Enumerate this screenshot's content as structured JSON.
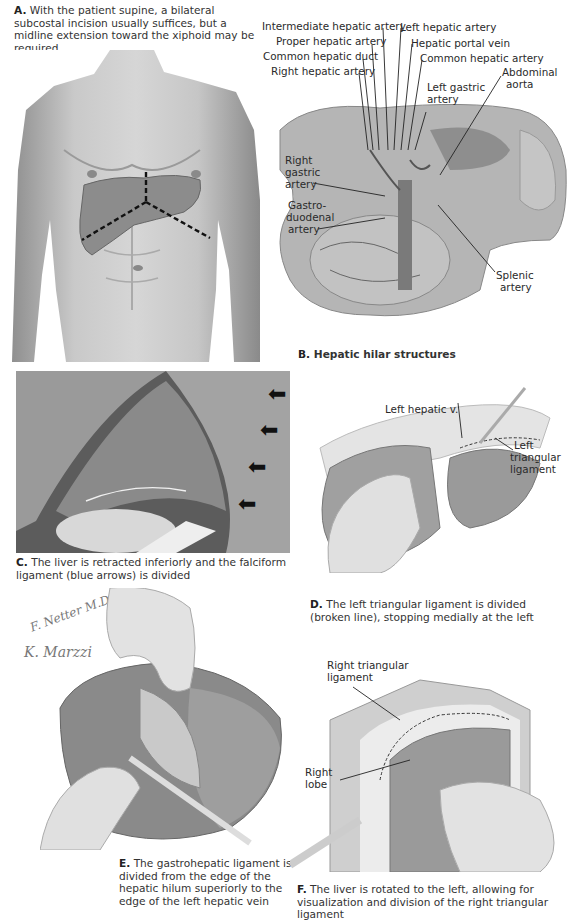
{
  "panels": {
    "A": {
      "letter": "A.",
      "caption": " With the patient supine, a bilateral subcostal incision usually suffices, but a midline extension toward the xiphoid may be required."
    },
    "B": {
      "letter": "B.",
      "caption": " Hepatic hilar structures",
      "labels": {
        "intermediate_hepatic_artery": "Intermediate hepatic artery",
        "proper_hepatic_artery": "Proper hepatic artery",
        "common_hepatic_duct": "Common hepatic duct",
        "right_hepatic_artery": "Right hepatic artery",
        "left_hepatic_artery": "Left hepatic artery",
        "hepatic_portal_vein": "Hepatic portal vein",
        "common_hepatic_artery": "Common hepatic artery",
        "abdominal_aorta_1": "Abdominal",
        "abdominal_aorta_2": "aorta",
        "left_gastric_artery_1": "Left gastric",
        "left_gastric_artery_2": "artery",
        "right_gastric_artery_1": "Right",
        "right_gastric_artery_2": "gastric",
        "right_gastric_artery_3": "artery",
        "gastroduodenal_artery_1": "Gastro-",
        "gastroduodenal_artery_2": "duodenal",
        "gastroduodenal_artery_3": "artery",
        "splenic_artery_1": "Splenic",
        "splenic_artery_2": "artery"
      }
    },
    "C": {
      "letter": "C.",
      "caption": " The liver is retracted inferiorly and the falciform ligament (blue arrows) is divided"
    },
    "D": {
      "letter": "D.",
      "caption": " The left triangular ligament is divided (broken line), stopping medially at the left",
      "labels": {
        "left_hepatic_v": "Left hepatic v.",
        "left_triangular_1": "Left",
        "left_triangular_2": "triangular",
        "left_triangular_3": "ligament"
      }
    },
    "E": {
      "letter": "E.",
      "caption": " The gastrohepatic ligament is divided from the edge of the hepatic hilum superiorly to the edge of the left hepatic vein",
      "signatures": {
        "netter": "F. Netter M.D.",
        "marzzi": "K. Marzzi"
      }
    },
    "F": {
      "letter": "F.",
      "caption": " The liver is rotated to the left, allowing for visualization and division of the right triangular ligament",
      "labels": {
        "right_triangular_1": "Right triangular",
        "right_triangular_2": "ligament",
        "right_lobe_1": "Right",
        "right_lobe_2": "lobe"
      }
    }
  }
}
